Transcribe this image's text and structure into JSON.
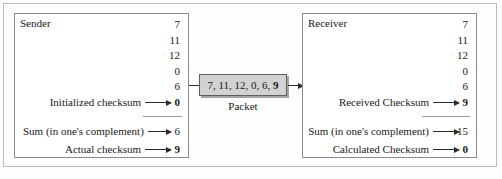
{
  "figure": {
    "sender": {
      "title": "Sender",
      "numbers": [
        {
          "value": "7",
          "bold": false
        },
        {
          "value": "11",
          "bold": false
        },
        {
          "value": "12",
          "bold": false
        },
        {
          "value": "0",
          "bold": false
        },
        {
          "value": "6",
          "bold": false
        }
      ],
      "rows": [
        {
          "label": "Initialized checksum",
          "value": "0",
          "bold": true
        },
        {
          "label": "Sum (in one's complement)",
          "value": "6",
          "bold": false
        },
        {
          "label": "Actual checksum",
          "value": "9",
          "bold": true
        }
      ]
    },
    "receiver": {
      "title": "Receiver",
      "numbers": [
        {
          "value": "7",
          "bold": false
        },
        {
          "value": "11",
          "bold": false
        },
        {
          "value": "12",
          "bold": false
        },
        {
          "value": "0",
          "bold": false
        },
        {
          "value": "6",
          "bold": false
        }
      ],
      "rows": [
        {
          "label": "Received Checksum",
          "value": "9",
          "bold": true
        },
        {
          "label": "Sum (in one's complement)",
          "value": "15",
          "bold": false
        },
        {
          "label": "Calculated Checksum",
          "value": "0",
          "bold": true
        }
      ]
    },
    "packet": {
      "data_prefix": "7, 11, 12, 0, 6, ",
      "data_checksum": "9",
      "caption": "Packet"
    },
    "colors": {
      "packet_fill": "#d2d2d2",
      "packet_border": "#5e5e5e",
      "box_border": "#8a8a8a",
      "frame_border": "#bdbdbd",
      "line": "#2b2b2b",
      "text": "#1a1a1a"
    }
  }
}
